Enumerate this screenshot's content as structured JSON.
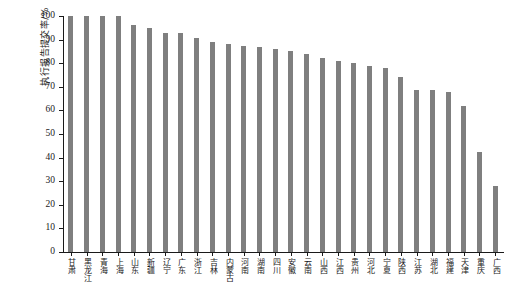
{
  "chart_data": {
    "type": "bar",
    "title": "",
    "xlabel": "",
    "ylabel": "执行报告提交率/%",
    "ylim": [
      0,
      100
    ],
    "yticks": [
      0,
      10,
      20,
      30,
      40,
      50,
      60,
      70,
      80,
      90,
      100
    ],
    "grid": false,
    "legend": null,
    "bar_color": "#7f7f7f",
    "axis_color": "#1a1a1a",
    "categories": [
      "甘肃",
      "黑龙江",
      "青海",
      "上海",
      "山东",
      "新疆",
      "辽宁",
      "广东",
      "浙江",
      "吉林",
      "内蒙古",
      "河南",
      "湖南",
      "四川",
      "安徽",
      "云南",
      "山西",
      "江西",
      "贵州",
      "河北",
      "宁夏",
      "陕西",
      "江苏",
      "湖北",
      "福建",
      "天津",
      "重庆",
      "广西"
    ],
    "values": [
      100,
      100,
      100,
      100,
      96,
      95,
      93,
      93,
      90.5,
      89,
      88,
      87.5,
      87,
      86,
      85,
      84,
      82,
      81,
      80,
      79,
      78,
      74,
      68.5,
      68.5,
      68,
      62,
      42.5,
      28
    ]
  }
}
